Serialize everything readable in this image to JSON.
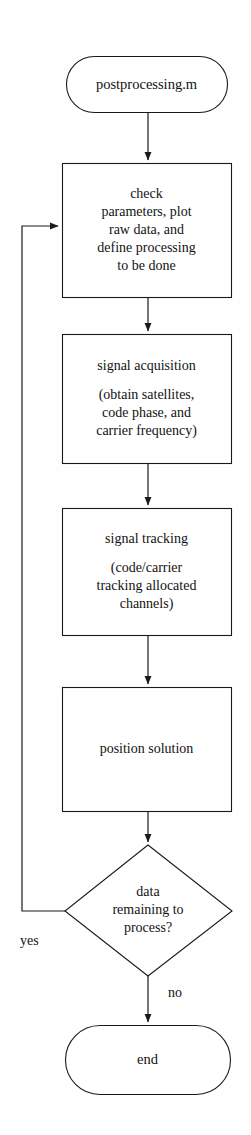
{
  "diagram": {
    "type": "flowchart",
    "orientation": "top-to-bottom",
    "background_color": "#fefefe",
    "stroke_color": "#1a1a1a",
    "text_color": "#121212",
    "nodes": [
      {
        "id": "start",
        "shape": "terminator",
        "label": "postprocessing.m"
      },
      {
        "id": "check",
        "shape": "process",
        "label": "check\nparameters, plot\nraw data, and\ndefine processing\nto be done"
      },
      {
        "id": "acquisition",
        "shape": "process",
        "label_primary": "signal acquisition",
        "label_secondary": "(obtain satellites,\ncode phase, and\ncarrier frequency)"
      },
      {
        "id": "tracking",
        "shape": "process",
        "label_primary": "signal tracking",
        "label_secondary": "(code/carrier\ntracking allocated\nchannels)"
      },
      {
        "id": "position",
        "shape": "process",
        "label": "position solution"
      },
      {
        "id": "decision",
        "shape": "decision",
        "label": "data\nremaining to\nprocess?"
      },
      {
        "id": "end",
        "shape": "terminator",
        "label": "end"
      }
    ],
    "edges": [
      {
        "id": "e-start-check",
        "from": "start",
        "to": "check",
        "label": ""
      },
      {
        "id": "e-check-acq",
        "from": "check",
        "to": "acquisition",
        "label": ""
      },
      {
        "id": "e-acq-track",
        "from": "acquisition",
        "to": "tracking",
        "label": ""
      },
      {
        "id": "e-track-pos",
        "from": "tracking",
        "to": "position",
        "label": ""
      },
      {
        "id": "e-pos-dec",
        "from": "position",
        "to": "decision",
        "label": ""
      },
      {
        "id": "e-dec-loop",
        "from": "decision",
        "to": "check",
        "label": "yes"
      },
      {
        "id": "e-dec-end",
        "from": "decision",
        "to": "end",
        "label": "no"
      }
    ]
  }
}
